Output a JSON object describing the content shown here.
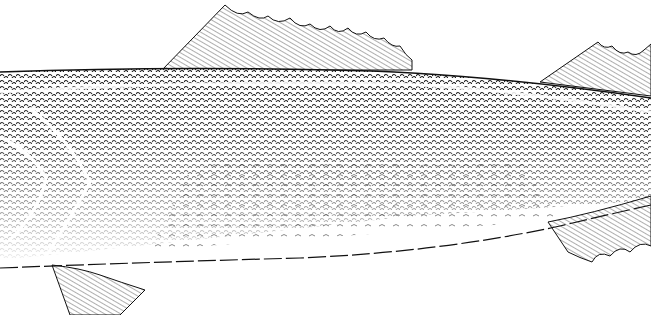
{
  "image": {
    "subject": "fish body illustration (pen-and-ink)",
    "width": 651,
    "height": 315,
    "colors": {
      "ink": "#111111",
      "paper": "#ffffff",
      "shade": "#333333"
    }
  },
  "parts": [
    {
      "name": "spiny-dorsal-fin"
    },
    {
      "name": "soft-dorsal-fin"
    },
    {
      "name": "pelvic-fin"
    },
    {
      "name": "anal-fin"
    },
    {
      "name": "gill-cover"
    },
    {
      "name": "lateral-line"
    },
    {
      "name": "belly-line"
    }
  ]
}
